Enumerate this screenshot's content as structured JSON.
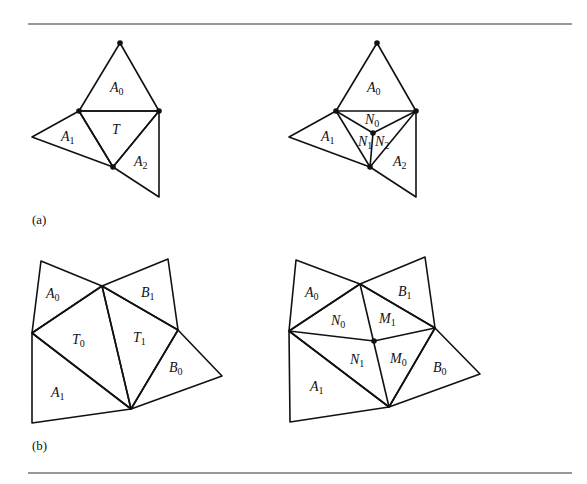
{
  "figure": {
    "captions": {
      "a": "(a)",
      "b": "(b)"
    },
    "panels": [
      {
        "id": "a-left",
        "description": "Triangle T with neighbors A0, A1, A2",
        "labels": [
          {
            "base": "A",
            "sub": "0",
            "x": 110,
            "y": 92
          },
          {
            "base": "A",
            "sub": "1",
            "x": 61,
            "y": 141
          },
          {
            "base": "T",
            "sub": "",
            "x": 112,
            "y": 134
          },
          {
            "base": "A",
            "sub": "2",
            "x": 134,
            "y": 166
          }
        ]
      },
      {
        "id": "a-right",
        "description": "T split into N0, N1, N2 by a new center vertex",
        "labels": [
          {
            "base": "A",
            "sub": "0",
            "x": 367,
            "y": 92
          },
          {
            "base": "A",
            "sub": "1",
            "x": 321,
            "y": 141
          },
          {
            "base": "N",
            "sub": "0",
            "x": 365,
            "y": 124
          },
          {
            "base": "N",
            "sub": "1",
            "x": 358,
            "y": 146
          },
          {
            "base": "N",
            "sub": "2",
            "x": 375,
            "y": 146
          },
          {
            "base": "A",
            "sub": "2",
            "x": 393,
            "y": 166
          }
        ]
      },
      {
        "id": "b-left",
        "description": "Adjacent triangles T0 and T1 with neighbors A0, A1, B0, B1",
        "labels": [
          {
            "base": "A",
            "sub": "0",
            "x": 46,
            "y": 298
          },
          {
            "base": "B",
            "sub": "1",
            "x": 141,
            "y": 297
          },
          {
            "base": "T",
            "sub": "0",
            "x": 72,
            "y": 344
          },
          {
            "base": "T",
            "sub": "1",
            "x": 133,
            "y": 342
          },
          {
            "base": "B",
            "sub": "0",
            "x": 169,
            "y": 372
          },
          {
            "base": "A",
            "sub": "1",
            "x": 51,
            "y": 397
          }
        ]
      },
      {
        "id": "b-right",
        "description": "T0 and T1 split into N0, N1, M0, M1 by a new vertex on the shared edge",
        "labels": [
          {
            "base": "A",
            "sub": "0",
            "x": 305,
            "y": 297
          },
          {
            "base": "B",
            "sub": "1",
            "x": 398,
            "y": 296
          },
          {
            "base": "N",
            "sub": "0",
            "x": 331,
            "y": 325
          },
          {
            "base": "M",
            "sub": "1",
            "x": 379,
            "y": 323
          },
          {
            "base": "N",
            "sub": "1",
            "x": 350,
            "y": 364
          },
          {
            "base": "M",
            "sub": "0",
            "x": 390,
            "y": 363
          },
          {
            "base": "B",
            "sub": "0",
            "x": 433,
            "y": 372
          },
          {
            "base": "A",
            "sub": "1",
            "x": 310,
            "y": 391
          }
        ]
      }
    ]
  }
}
